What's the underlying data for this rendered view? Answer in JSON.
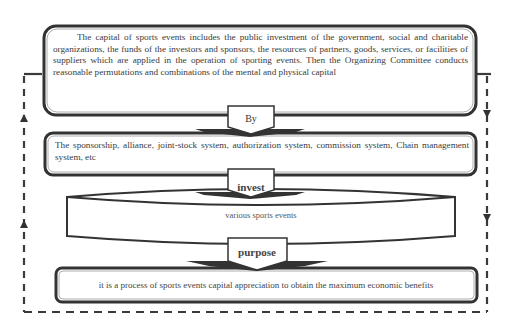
{
  "diagram": {
    "type": "flowchart",
    "boxes": [
      {
        "id": "capital",
        "text": "The capital of sports events includes the public investment of the government, social and charitable organizations, the funds of the investors and sponsors, the resources of partners, goods, services, or facilities of suppliers which are applied in the operation of sporting events. Then the Organizing Committee conducts reasonable permutations and combinations of the mental and physical capital"
      },
      {
        "id": "systems",
        "text": "The sponsorship, alliance, joint-stock system, authorization system, commission system, Chain management system, etc"
      },
      {
        "id": "events",
        "shape": "cylinder",
        "text": "various sports events"
      },
      {
        "id": "goal",
        "text": "it is a process of sports events capital appreciation to obtain the maximum economic benefits"
      }
    ],
    "connectors": [
      {
        "from": "capital",
        "to": "systems",
        "label": "By"
      },
      {
        "from": "systems",
        "to": "events",
        "label": "invest"
      },
      {
        "from": "events",
        "to": "goal",
        "label": "purpose"
      }
    ],
    "feedback_loop": {
      "style": "dashed",
      "left_direction": "up",
      "right_direction": "down"
    }
  },
  "colors": {
    "stroke": "#333333",
    "dash": "#3a3a3a",
    "text": "#3a3a3a",
    "background": "#ffffff"
  }
}
